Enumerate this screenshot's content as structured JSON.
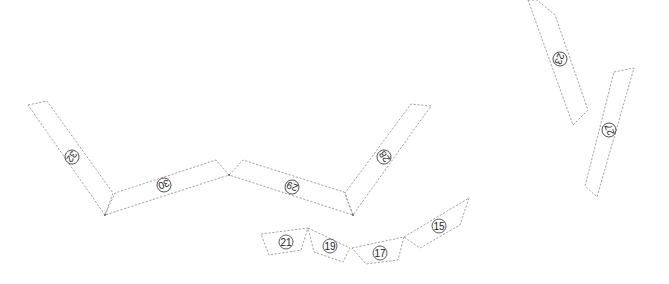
{
  "diagram": {
    "type": "dashed-outline segmented plan (numbered panels)",
    "width": 669,
    "height": 284,
    "colors": {
      "outline": "#8a8a8a",
      "label_ring": "#333333",
      "label_text": "#222222",
      "background": "#ffffff"
    },
    "segments": [
      {
        "id": "32",
        "label": "32",
        "points": "28,105 47,101 113,193 105,215",
        "label_pos": [
          72,
          157
        ],
        "label_rotation": 125
      },
      {
        "id": "30",
        "label": "30",
        "points": "105,215 115,193 216,160 229,175",
        "label_pos": [
          164,
          185
        ],
        "label_rotation": 160
      },
      {
        "id": "29",
        "label": "29",
        "points": "229,175 243,160 344,192 353,215",
        "label_pos": [
          292,
          187
        ],
        "label_rotation": 200
      },
      {
        "id": "28",
        "label": "28",
        "points": "353,215 345,193 411,104 431,106",
        "label_pos": [
          384,
          157
        ],
        "label_rotation": 235
      },
      {
        "id": "21",
        "label": "21",
        "points": "261,234 308,228 301,250 269,255",
        "label_pos": [
          286,
          242
        ],
        "label_rotation": 0
      },
      {
        "id": "19",
        "label": "19",
        "points": "308,228 350,248 343,262 314,252",
        "label_pos": [
          330,
          246
        ],
        "label_rotation": 0
      },
      {
        "id": "17",
        "label": "17",
        "points": "352,248 404,237 398,260 366,264",
        "label_pos": [
          380,
          253
        ],
        "label_rotation": 0
      },
      {
        "id": "15",
        "label": "15",
        "points": "404,237 469,198 460,225 420,248",
        "label_pos": [
          439,
          226
        ],
        "label_rotation": 0
      },
      {
        "id": "23",
        "label": "23",
        "points": "528,0 537,0 555,15 588,110 573,125",
        "label_pos": [
          560,
          59
        ],
        "label_rotation": 110
      },
      {
        "id": "27",
        "label": "27",
        "points": "614,72 634,68 597,197 585,186",
        "label_pos": [
          609,
          130
        ],
        "label_rotation": 250
      }
    ],
    "vertices": [
      {
        "id": "v-left",
        "pos": [
          105,
          215
        ]
      },
      {
        "id": "v-mid",
        "pos": [
          229,
          175
        ]
      },
      {
        "id": "v-right",
        "pos": [
          353,
          215
        ]
      }
    ]
  }
}
